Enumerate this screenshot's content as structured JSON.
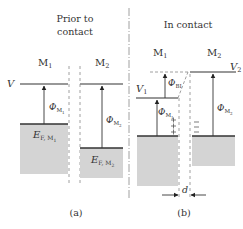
{
  "panel_a": {
    "title_line1": "Prior to",
    "title_line2": "contact",
    "metal1_label": "M",
    "metal1_sub": "1",
    "metal2_label": "M",
    "metal2_sub": "2",
    "vacuum_label": "V",
    "phi_m1": "Φ",
    "phi_m1_sub": "M",
    "phi_m1_subsub": "1",
    "phi_m2": "Φ",
    "phi_m2_sub": "M",
    "phi_m2_subsub": "2",
    "ef_m1": "E",
    "ef_m1_sub": "F, M",
    "ef_m1_subsub": "1",
    "ef_m2": "E",
    "ef_m2_sub": "F, M",
    "ef_m2_subsub": "2",
    "caption": "(a)"
  },
  "panel_b": {
    "title": "In contact",
    "metal1_label": "M",
    "metal1_sub": "1",
    "metal2_label": "M",
    "metal2_sub": "2",
    "v1_label": "V",
    "v1_sub": "1",
    "v2_label": "V",
    "v2_sub": "2",
    "phi_bi": "Φ",
    "phi_bi_sub": "BI",
    "phi_m1": "Φ",
    "phi_m1_sub": "M",
    "phi_m1_subsub": "1",
    "phi_m2": "Φ",
    "phi_m2_sub": "M",
    "phi_m2_subsub": "2",
    "gap_label": "d",
    "caption": "(b)"
  },
  "colors": {
    "fill_band": "#d4d4d4",
    "line": "#333333",
    "dashed": "#888888"
  }
}
